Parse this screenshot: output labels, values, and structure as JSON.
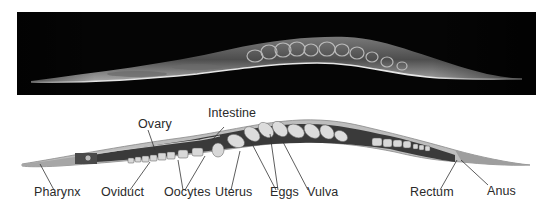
{
  "figure": {
    "photo": {
      "description": "Micrograph of C. elegans hermaphrodite",
      "background": "#050505"
    },
    "drawing": {
      "colors": {
        "body_wall": "#bdbdbd",
        "body_outline": "#8a8a8a",
        "intestine": "#3a3a3a",
        "gonad_light": "#d8d8d8",
        "eggs": "#dcdcdc",
        "pharynx": "#9a9a9a"
      }
    },
    "labels": [
      {
        "id": "pharynx",
        "text": "Pharynx"
      },
      {
        "id": "oviduct",
        "text": "Oviduct"
      },
      {
        "id": "oocytes",
        "text": "Oocytes"
      },
      {
        "id": "uterus",
        "text": "Uterus"
      },
      {
        "id": "eggs",
        "text": "Eggs"
      },
      {
        "id": "vulva",
        "text": "Vulva"
      },
      {
        "id": "rectum",
        "text": "Rectum"
      },
      {
        "id": "anus",
        "text": "Anus"
      },
      {
        "id": "ovary",
        "text": "Ovary"
      },
      {
        "id": "intestine",
        "text": "Intestine"
      }
    ]
  }
}
